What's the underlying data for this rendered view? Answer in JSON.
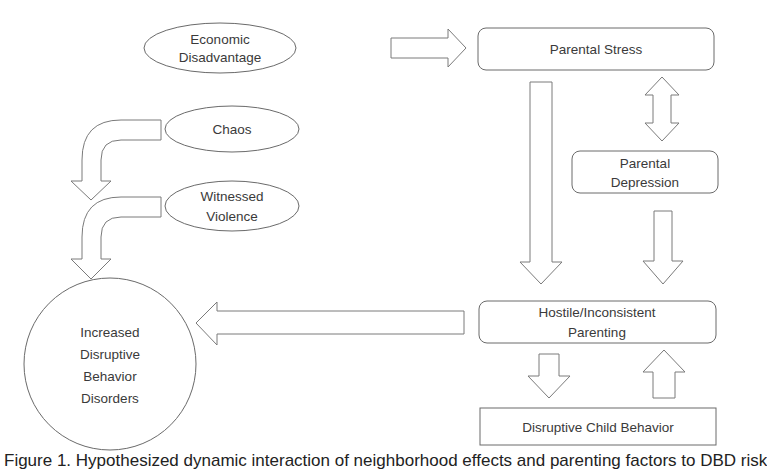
{
  "diagram": {
    "nodes": {
      "economic_disadvantage": {
        "shape": "ellipse",
        "lines": [
          "Economic",
          "Disadvantage"
        ]
      },
      "parental_stress": {
        "shape": "rounded-rect",
        "lines": [
          "Parental Stress"
        ]
      },
      "chaos": {
        "shape": "ellipse",
        "lines": [
          "Chaos"
        ]
      },
      "witnessed_violence": {
        "shape": "ellipse",
        "lines": [
          "Witnessed",
          "Violence"
        ]
      },
      "parental_depression": {
        "shape": "rounded-rect",
        "lines": [
          "Parental",
          "Depression"
        ]
      },
      "hostile_parenting": {
        "shape": "rounded-rect",
        "lines": [
          "Hostile/Inconsistent",
          "Parenting"
        ]
      },
      "disruptive_child_behavior": {
        "shape": "rect",
        "lines": [
          "Disruptive Child Behavior"
        ]
      },
      "increased_dbd": {
        "shape": "circle",
        "lines": [
          "Increased",
          "Disruptive",
          "Behavior",
          "Disorders"
        ]
      }
    },
    "edges": [
      {
        "from": "Economic Disadvantage",
        "to": "Parental Stress",
        "type": "block-arrow-right"
      },
      {
        "from": "Parental Stress",
        "to": "Parental Depression",
        "type": "block-arrow-bidirectional"
      },
      {
        "from": "Parental Stress",
        "to": "Hostile/Inconsistent Parenting",
        "type": "block-arrow-down"
      },
      {
        "from": "Parental Depression",
        "to": "Hostile/Inconsistent Parenting",
        "type": "block-arrow-down"
      },
      {
        "from": "Hostile/Inconsistent Parenting",
        "to": "Disruptive Child Behavior",
        "type": "block-arrow-down"
      },
      {
        "from": "Disruptive Child Behavior",
        "to": "Hostile/Inconsistent Parenting",
        "type": "block-arrow-up"
      },
      {
        "from": "Hostile/Inconsistent Parenting",
        "to": "Increased Disruptive Behavior Disorders",
        "type": "block-arrow-left"
      },
      {
        "from": "Chaos",
        "to": "Increased Disruptive Behavior Disorders",
        "type": "bent-arrow"
      },
      {
        "from": "Witnessed Violence",
        "to": "Increased Disruptive Behavior Disorders",
        "type": "bent-arrow"
      }
    ],
    "colors": {
      "stroke": "#6a6a6a",
      "fill": "#ffffff",
      "text": "#3a3a3a"
    }
  },
  "caption": "Figure 1. Hypothesized dynamic interaction of neighborhood effects and parenting factors to DBD risk"
}
